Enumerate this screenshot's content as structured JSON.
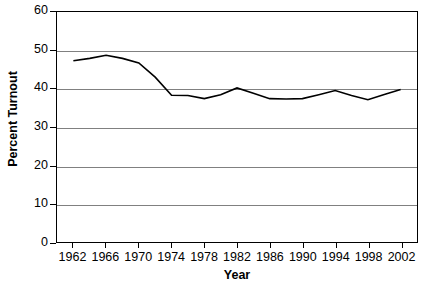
{
  "chart_data": {
    "type": "line",
    "title": "",
    "xlabel": "Year",
    "ylabel": "Percent Turnout",
    "xlim": [
      1960,
      2004
    ],
    "ylim": [
      0,
      60
    ],
    "grid": true,
    "legend": "none",
    "x_tick_labels": [
      "1962",
      "1966",
      "1970",
      "1974",
      "1978",
      "1982",
      "1986",
      "1990",
      "1994",
      "1998",
      "2002"
    ],
    "x_tick_values": [
      1962,
      1966,
      1970,
      1974,
      1978,
      1982,
      1986,
      1990,
      1994,
      1998,
      2002
    ],
    "y_tick_labels": [
      "0",
      "10",
      "20",
      "30",
      "40",
      "50",
      "60"
    ],
    "y_tick_values": [
      0,
      10,
      20,
      30,
      40,
      50,
      60
    ],
    "series": [
      {
        "name": "Percent Turnout",
        "color": "#000000",
        "x": [
          1962,
          1964,
          1966,
          1968,
          1970,
          1972,
          1974,
          1976,
          1978,
          1980,
          1982,
          1984,
          1986,
          1988,
          1990,
          1992,
          1994,
          1996,
          1998,
          2000,
          2002
        ],
        "values": [
          47.3,
          47.9,
          48.7,
          47.9,
          46.7,
          43.0,
          38.3,
          38.2,
          37.4,
          38.4,
          40.2,
          38.8,
          37.4,
          37.3,
          37.4,
          38.4,
          39.5,
          38.2,
          37.1,
          38.5,
          39.8
        ]
      }
    ]
  },
  "axes": {
    "y_title": "Percent Turnout",
    "x_title": "Year"
  }
}
